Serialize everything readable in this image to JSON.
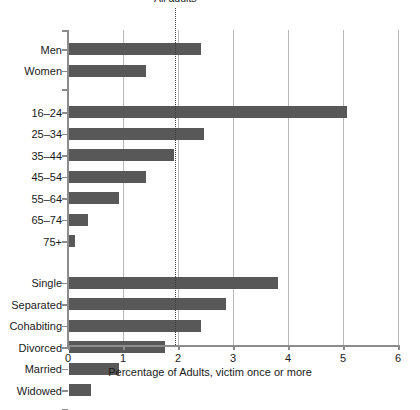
{
  "chart_data": {
    "type": "bar",
    "orientation": "horizontal",
    "title": "",
    "xlabel": "Percentage of Adults, victim once or more",
    "ylabel": "",
    "xlim": [
      0,
      6
    ],
    "xticks": [
      0,
      1,
      2,
      3,
      4,
      5,
      6
    ],
    "xtick_labels": [
      "0",
      "1",
      "2",
      "3",
      "4",
      "5",
      "6"
    ],
    "grid": "vertical",
    "legend": "none",
    "bar_color": "#585858",
    "annotations": [
      {
        "name": "all-adults-reference-line",
        "label": "All adults",
        "value": 1.95,
        "style": "dotted-vertical"
      }
    ],
    "groups": [
      {
        "name": "sex",
        "categories": [
          "Men",
          "Women"
        ],
        "values": [
          2.4,
          1.4
        ]
      },
      {
        "name": "age",
        "categories": [
          "16–24",
          "25–34",
          "35–44",
          "45–54",
          "55–64",
          "65–74",
          "75+"
        ],
        "values": [
          5.05,
          2.45,
          1.9,
          1.4,
          0.9,
          0.35,
          0.1
        ]
      },
      {
        "name": "marital-status",
        "categories": [
          "Single",
          "Separated",
          "Cohabiting",
          "Divorced",
          "Married",
          "Widowed"
        ],
        "values": [
          3.8,
          2.85,
          2.4,
          1.75,
          0.9,
          0.4
        ]
      }
    ],
    "categories": [
      "Men",
      "Women",
      "16–24",
      "25–34",
      "35–44",
      "45–54",
      "55–64",
      "65–74",
      "75+",
      "Single",
      "Separated",
      "Cohabiting",
      "Divorced",
      "Married",
      "Widowed"
    ],
    "values": [
      2.4,
      1.4,
      5.05,
      2.45,
      1.9,
      1.4,
      0.9,
      0.35,
      0.1,
      3.8,
      2.85,
      2.4,
      1.75,
      0.9,
      0.4
    ]
  }
}
